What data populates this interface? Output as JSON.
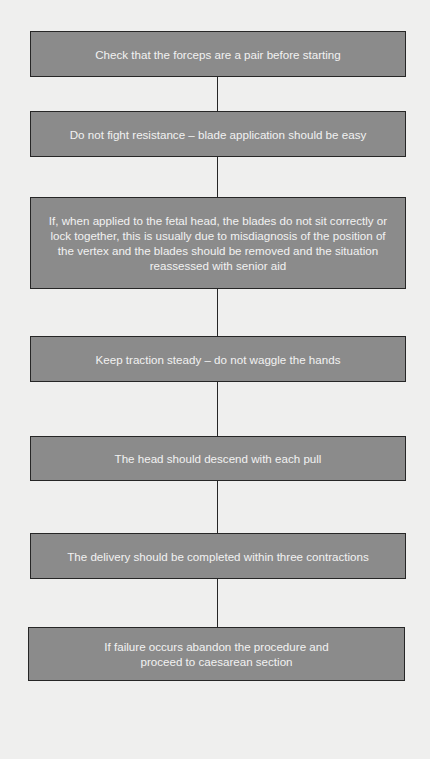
{
  "flowchart": {
    "steps": [
      {
        "text": "Check that the forceps are a pair before starting"
      },
      {
        "text": "Do not fight resistance – blade application should be easy"
      },
      {
        "text": "If, when applied to the fetal head, the blades do not sit correctly or lock together, this is usually due to misdiagnosis of the position of the vertex and the blades should be removed and the situation reassessed with senior aid"
      },
      {
        "text": "Keep traction steady – do not waggle the hands"
      },
      {
        "text": "The head should descend with each pull"
      },
      {
        "text": "The delivery should be completed within three contractions"
      },
      {
        "text": "If failure occurs abandon the procedure and proceed to caesarean section"
      }
    ],
    "colors": {
      "background": "#efefee",
      "box_fill": "#8b8b8b",
      "box_border": "#262626",
      "box_text": "#f2f2f2",
      "connector": "#262626"
    }
  }
}
